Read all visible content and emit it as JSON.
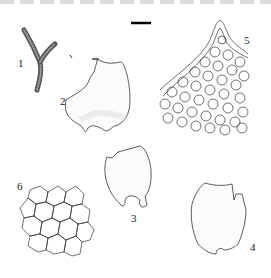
{
  "figure": {
    "type": "botanical illustration plate",
    "labels": [
      {
        "id": "1",
        "text": "1",
        "x": 18,
        "y": 58
      },
      {
        "id": "2",
        "text": "2",
        "x": 60,
        "y": 96
      },
      {
        "id": "3",
        "text": "3",
        "x": 131,
        "y": 214
      },
      {
        "id": "4",
        "text": "4",
        "x": 250,
        "y": 243
      },
      {
        "id": "5",
        "text": "5",
        "x": 244,
        "y": 36
      },
      {
        "id": "6",
        "text": "6",
        "x": 17,
        "y": 182
      }
    ],
    "scale_bar": {
      "x": 131,
      "y": 22,
      "width": 20
    }
  }
}
